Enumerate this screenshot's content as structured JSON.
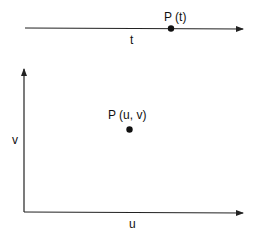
{
  "diagram": {
    "line_1d": {
      "point_label": "P (t)",
      "axis_label": "t"
    },
    "plane_2d": {
      "point_label": "P (u, v)",
      "x_axis_label": "u",
      "y_axis_label": "v"
    },
    "colors": {
      "stroke": "#222222",
      "point": "#111111"
    }
  }
}
